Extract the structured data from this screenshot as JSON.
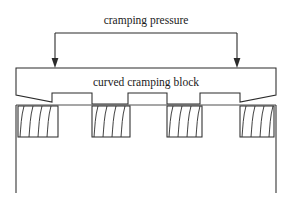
{
  "figure": {
    "type": "engineering-cross-section-diagram",
    "background_color": "#ffffff",
    "line_color": "#2b2b2b",
    "width": 292,
    "height": 199
  },
  "labels": {
    "pressure_label": "cramping pressure",
    "block_label": "curved cramping block"
  },
  "annotations": {
    "pressure_bracket": {
      "description": "horizontal bracket with two downward arrows indicating applied pressure",
      "arrow_count": 2,
      "left_arrow_x": 55,
      "right_arrow_x": 237,
      "bracket_y": 33,
      "arrow_tip_y": 68
    }
  },
  "geometry": {
    "clamping_block": {
      "name": "curved cramping block",
      "left": 16,
      "right": 276,
      "top": 68,
      "body_bottom": 95,
      "left_taper_depth": 7,
      "right_taper_depth": 7,
      "tooth_top_y": 93,
      "tooth_bottom_y": 104,
      "teeth": [
        {
          "x0": 52,
          "x1": 92
        },
        {
          "x0": 128,
          "x1": 167
        },
        {
          "x0": 200,
          "x1": 240
        }
      ],
      "tooth_count": 3
    },
    "substrate": {
      "name": "substrate",
      "left": 16,
      "right": 276,
      "top": 105,
      "bottom": 193,
      "surface_line_y": 105
    },
    "hatched_blocks": {
      "count": 4,
      "top": 106,
      "bottom": 137,
      "hatch_lines_per_block": 4,
      "items": [
        {
          "x0": 18,
          "x1": 58
        },
        {
          "x0": 92,
          "x1": 130
        },
        {
          "x0": 167,
          "x1": 202
        },
        {
          "x0": 240,
          "x1": 274
        }
      ]
    }
  }
}
